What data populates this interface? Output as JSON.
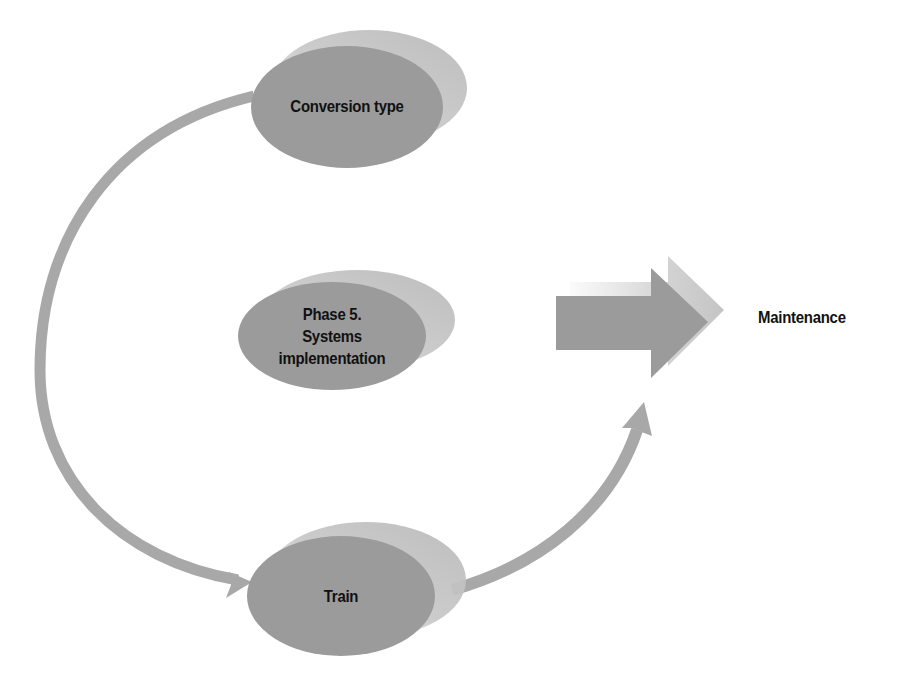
{
  "diagram": {
    "type": "process-cycle",
    "colors": {
      "node_fill": "#9b9b9b",
      "node_back": "#c9c9c9",
      "connector": "#a8a8a8",
      "text": "#111111",
      "background": "#ffffff"
    },
    "nodes": [
      {
        "id": "conversion",
        "label": "Conversion type"
      },
      {
        "id": "phase",
        "label_lines": [
          "Phase 5.",
          "Systems",
          "implementation"
        ]
      },
      {
        "id": "train",
        "label": "Train"
      }
    ],
    "outcome": {
      "label": "Maintenance"
    },
    "edges": [
      {
        "from": "conversion",
        "to": "train",
        "style": "curved-arrow"
      },
      {
        "from": "train",
        "to": "maintenance",
        "style": "curved-arrow"
      },
      {
        "from": "phase",
        "to": "maintenance",
        "style": "block-arrow"
      }
    ]
  }
}
